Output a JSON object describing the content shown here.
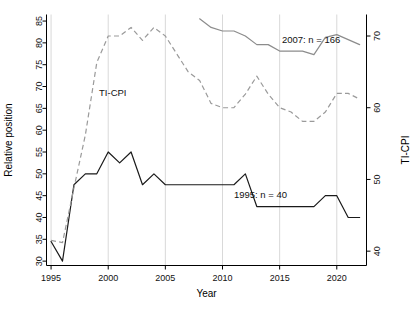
{
  "chart_data": {
    "type": "line",
    "title": "",
    "xlabel": "Year",
    "ylabel": "Relative position",
    "y2label": "TI-CPI",
    "xlim": [
      1994.6,
      2022.6
    ],
    "ylim": [
      29.0,
      86.5
    ],
    "y2lim": [
      38.0,
      73.0
    ],
    "xticks": [
      1995,
      2000,
      2005,
      2010,
      2015,
      2020
    ],
    "xticklabels": [
      "1995",
      "2000",
      "2005",
      "2010",
      "2015",
      "2020"
    ],
    "yticks": [
      30,
      35,
      40,
      45,
      50,
      55,
      60,
      65,
      70,
      75,
      80,
      85
    ],
    "yticklabels": [
      "30",
      "35",
      "40",
      "45",
      "50",
      "55",
      "60",
      "65",
      "70",
      "75",
      "80",
      "85"
    ],
    "y2ticks": [
      40,
      50,
      60,
      70
    ],
    "y2ticklabels": [
      "40",
      "50",
      "60",
      "70"
    ],
    "grid": "vertical gridlines at x ticks",
    "legend_position": "inline annotations",
    "series": [
      {
        "name": "1995: n = 40",
        "axis": "left",
        "style": "solid",
        "color": "#1a1a1a",
        "label_text": "1995: n = 40",
        "x": [
          1995,
          1996,
          1997,
          1998,
          1999,
          2000,
          2001,
          2002,
          2003,
          2004,
          2005,
          2006,
          2007,
          2008,
          2009,
          2010,
          2011,
          2012,
          2013,
          2014,
          2015,
          2016,
          2017,
          2018,
          2019,
          2020,
          2021,
          2022
        ],
        "values": [
          34.5,
          30.0,
          47.5,
          50.0,
          50.0,
          55.0,
          52.5,
          55.0,
          47.5,
          50.0,
          47.5,
          47.5,
          47.5,
          47.5,
          47.5,
          47.5,
          47.5,
          50.0,
          42.5,
          42.5,
          42.5,
          42.5,
          42.5,
          42.5,
          45.0,
          45.0,
          40.0,
          40.0
        ]
      },
      {
        "name": "2007: n = 166",
        "axis": "right",
        "style": "solid",
        "color": "#8c8c8c",
        "label_text": "2007: n = 166",
        "x": [
          2008,
          2009,
          2010,
          2011,
          2012,
          2013,
          2014,
          2015,
          2016,
          2017,
          2018,
          2019,
          2020,
          2021,
          2022
        ],
        "values": [
          72.4,
          71.2,
          70.7,
          70.7,
          70.0,
          68.8,
          68.8,
          67.9,
          67.9,
          67.9,
          67.4,
          69.8,
          70.2,
          69.5,
          68.8
        ]
      },
      {
        "name": "TI-CPI",
        "axis": "right",
        "style": "dashed",
        "color": "#9a9a9a",
        "label_text": "TI-CPI",
        "x": [
          1995,
          1996,
          1997,
          1998,
          1999,
          2000,
          2001,
          2002,
          2003,
          2004,
          2005,
          2006,
          2007,
          2008,
          2009,
          2010,
          2011,
          2012,
          2013,
          2014,
          2015,
          2016,
          2017,
          2018,
          2019,
          2020,
          2021,
          2022
        ],
        "values": [
          41.5,
          41.2,
          48.8,
          56.2,
          66.3,
          70.0,
          70.0,
          71.2,
          69.4,
          71.2,
          70.0,
          67.5,
          65.0,
          63.8,
          60.6,
          60.0,
          60.0,
          61.9,
          64.4,
          61.9,
          60.0,
          59.4,
          58.1,
          58.1,
          59.4,
          62.0,
          62.0,
          61.2
        ]
      }
    ],
    "annotations": [
      {
        "text": "TI-CPI",
        "x": 1999.2,
        "y_left": 68.5
      },
      {
        "text": "1995: n = 40",
        "x": 2011.0,
        "y_left": 45.0
      },
      {
        "text": "2007: n = 166",
        "x": 2015.2,
        "y_left": 80.6
      }
    ]
  }
}
